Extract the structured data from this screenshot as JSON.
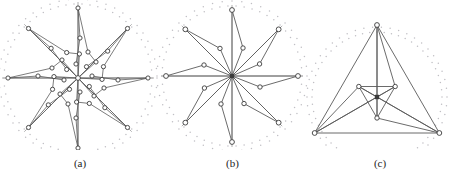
{
  "figure": {
    "background": "#ffffff",
    "edge_color": "#5a5a5a",
    "node_stroke": "#3b3b3b",
    "node_fill": "#ffffff",
    "dot_color": "#c0bfc4",
    "axis_color": "#8d8d8d"
  },
  "panels": [
    {
      "id": "a",
      "caption": "(a)",
      "center": [
        78,
        78
      ],
      "radius": 70,
      "symmetry": 8,
      "description": "dense 8-fold symmetric star graph with sub-branch nodes"
    },
    {
      "id": "b",
      "caption": "(b)",
      "center": [
        232,
        76
      ],
      "radius": 66,
      "symmetry": 8,
      "description": "8-fold symmetric star graph, simplified"
    },
    {
      "id": "c",
      "caption": "(c)",
      "center": [
        377,
        97
      ],
      "radius": 74,
      "symmetry": 3,
      "description": "3-fold symmetric triangular graph"
    }
  ],
  "chart_data": {
    "type": "scatter",
    "title": "",
    "xlabel": "",
    "ylabel": "",
    "panel_a": {
      "center": [
        78,
        78
      ],
      "ring_radius": 70,
      "spokes": 8,
      "spoke_tips": [
        [
          78,
          8
        ],
        [
          127,
          29
        ],
        [
          148,
          78
        ],
        [
          127,
          127
        ],
        [
          78,
          148
        ],
        [
          29,
          127
        ],
        [
          8,
          78
        ],
        [
          29,
          29
        ]
      ],
      "mid_nodes": [
        [
          78,
          52
        ],
        [
          96,
          60
        ],
        [
          104,
          78
        ],
        [
          96,
          96
        ],
        [
          78,
          104
        ],
        [
          60,
          96
        ],
        [
          52,
          78
        ],
        [
          60,
          60
        ]
      ],
      "inner_nodes": [
        [
          78,
          38
        ],
        [
          106,
          50
        ],
        [
          118,
          78
        ],
        [
          106,
          106
        ],
        [
          78,
          118
        ],
        [
          50,
          106
        ],
        [
          38,
          78
        ],
        [
          50,
          50
        ]
      ],
      "leaf_nodes": [
        [
          64,
          44
        ],
        [
          92,
          44
        ],
        [
          112,
          64
        ],
        [
          112,
          92
        ],
        [
          92,
          112
        ],
        [
          64,
          112
        ],
        [
          44,
          92
        ],
        [
          44,
          64
        ]
      ],
      "edges_per_arm": 5
    },
    "panel_b": {
      "center": [
        232,
        76
      ],
      "ring_radius": 66,
      "spokes": 8,
      "spoke_tips": [
        [
          232,
          14
        ],
        [
          278,
          32
        ],
        [
          296,
          76
        ],
        [
          278,
          120
        ],
        [
          232,
          138
        ],
        [
          186,
          120
        ],
        [
          168,
          76
        ],
        [
          186,
          32
        ]
      ],
      "mid_nodes": [
        [
          232,
          46
        ],
        [
          253,
          54
        ],
        [
          262,
          76
        ],
        [
          253,
          98
        ],
        [
          232,
          106
        ],
        [
          211,
          98
        ],
        [
          202,
          76
        ],
        [
          211,
          54
        ]
      ],
      "edges_per_arm": 3
    },
    "panel_c": {
      "center": [
        377,
        97
      ],
      "ring_radius": 74,
      "spokes": 3,
      "spoke_tips": [
        [
          377,
          22
        ],
        [
          446,
          136
        ],
        [
          305,
          136
        ]
      ],
      "mid_nodes": [
        [
          377,
          118
        ],
        [
          358,
          89
        ],
        [
          396,
          89
        ]
      ],
      "edges_per_arm": 4
    }
  }
}
